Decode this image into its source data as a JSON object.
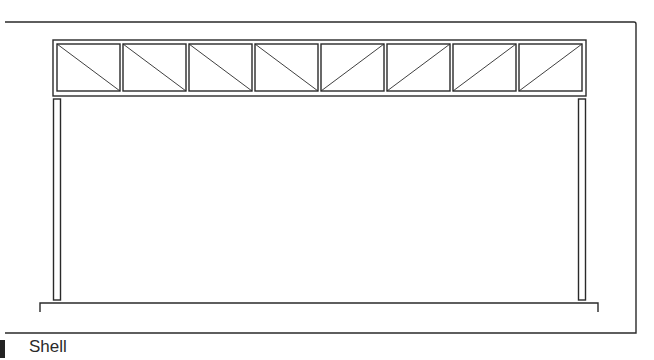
{
  "figure": {
    "caption": "Shell",
    "line_color": "#2a2a2a",
    "background": "#ffffff"
  },
  "diagram": {
    "type": "structural-elevation",
    "truss": {
      "panel_count": 8,
      "diagonals": [
        "down-right",
        "down-right",
        "down-right",
        "down-right",
        "up-right",
        "up-right",
        "up-right",
        "up-right"
      ]
    },
    "columns": [
      "left",
      "right"
    ],
    "base": "floor-slab"
  }
}
